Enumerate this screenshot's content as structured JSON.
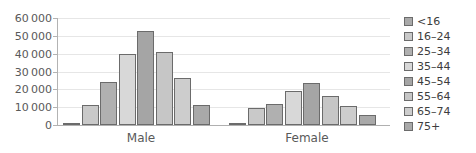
{
  "chart_data": {
    "type": "bar",
    "title": "",
    "subtitle": "",
    "xlabel": "",
    "ylabel": "",
    "ylim": [
      0,
      60000
    ],
    "grid": true,
    "legend_position": "right",
    "categories": [
      "Male",
      "Female"
    ],
    "series": [
      {
        "name": "<16",
        "values": [
          1000,
          1000
        ],
        "color": "#a9a9a9"
      },
      {
        "name": "16–24",
        "values": [
          11500,
          9500
        ],
        "color": "#c9c9c9"
      },
      {
        "name": "25–34",
        "values": [
          24000,
          12000
        ],
        "color": "#b0b0b0"
      },
      {
        "name": "35–44",
        "values": [
          40000,
          19000
        ],
        "color": "#d8d8d8"
      },
      {
        "name": "45–54",
        "values": [
          52500,
          23500
        ],
        "color": "#a5a5a5"
      },
      {
        "name": "55–64",
        "values": [
          40800,
          16500
        ],
        "color": "#c6c6c6"
      },
      {
        "name": "65–74",
        "values": [
          26500,
          10500
        ],
        "color": "#cdcdcd"
      },
      {
        "name": "75+",
        "values": [
          11200,
          5500
        ],
        "color": "#a9a9a9"
      }
    ],
    "y_ticks": [
      {
        "value": 0,
        "label": "0"
      },
      {
        "value": 10000,
        "label": "10 000"
      },
      {
        "value": 20000,
        "label": "20 000"
      },
      {
        "value": 30000,
        "label": "30 000"
      },
      {
        "value": 40000,
        "label": "40 000"
      },
      {
        "value": 50000,
        "label": "50 000"
      },
      {
        "value": 60000,
        "label": "60 000"
      }
    ]
  },
  "colors": {
    "axis": "#b3b3b3",
    "gridline": "#e6e6e6",
    "bar_outline": "#6b6b6b",
    "text": "#595959",
    "legend_text": "#3d3d3d",
    "background": "#ffffff"
  }
}
